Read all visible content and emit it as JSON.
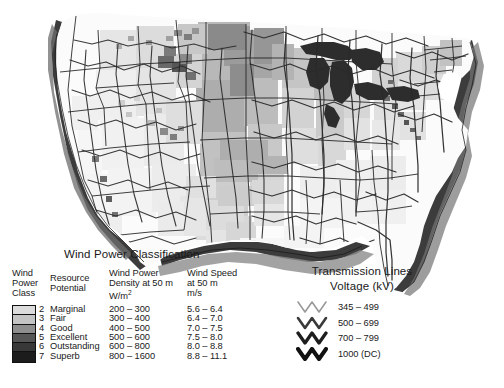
{
  "map": {
    "name": "united-states-wind-resource-map",
    "description": "Grayscale raster map of the contiguous United States showing wind power class shading with state boundaries and transmission lines",
    "region": "Contiguous United States",
    "background_color": "#ffffff",
    "state_border_color": "#1f1f1f",
    "coastal_offshore_color": "#3a3a3a",
    "transmission_line_color": "#2b2b2b"
  },
  "wind_legend": {
    "title": "Wind Power Classification",
    "headers": {
      "class": "Wind\nPower\nClass",
      "resource": "Resource\nPotential",
      "density": "Wind Power\nDensity at 50 m\nW/m",
      "density_superscript": "2",
      "speed": "Wind Speed\nat 50 m\nm/s"
    },
    "rows": [
      {
        "class": "2",
        "potential": "Marginal",
        "density": "200 – 300",
        "speed": "5.6 – 6.4",
        "color": "#dcdcdc"
      },
      {
        "class": "3",
        "potential": "Fair",
        "density": "300 – 400",
        "speed": "6.4 – 7.0",
        "color": "#c4c4c4"
      },
      {
        "class": "4",
        "potential": "Good",
        "density": "400 – 500",
        "speed": "7.0 – 7.5",
        "color": "#8e8e8e"
      },
      {
        "class": "5",
        "potential": "Excellent",
        "density": "500 – 600",
        "speed": "7.5 – 8.0",
        "color": "#565656"
      },
      {
        "class": "6",
        "potential": "Outstanding",
        "density": "600 – 800",
        "speed": "8.0 – 8.8",
        "color": "#383838"
      },
      {
        "class": "7",
        "potential": "Superb",
        "density": "800 – 1600",
        "speed": "8.8 – 11.1",
        "color": "#1c1c1c"
      }
    ]
  },
  "transmission_legend": {
    "title": "Transmission Lines\nVoltage (kV)",
    "rows": [
      {
        "label": "345 – 499",
        "color": "#9a9a9a",
        "width": 1.6
      },
      {
        "label": "500 – 699",
        "color": "#3a3a3a",
        "width": 2.6
      },
      {
        "label": "700 – 799",
        "color": "#1e1e1e",
        "width": 3.3
      },
      {
        "label": "1000 (DC)",
        "color": "#111111",
        "width": 4.0
      }
    ]
  }
}
